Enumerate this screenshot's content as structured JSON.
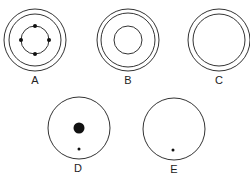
{
  "figures": [
    {
      "id": "A",
      "label": "A",
      "center": [
        35,
        40
      ],
      "rings": [
        31,
        26,
        14
      ],
      "dots": [
        {
          "x": 35,
          "y": 26,
          "r": 2
        },
        {
          "x": 35,
          "y": 54,
          "r": 2
        },
        {
          "x": 21,
          "y": 40,
          "r": 2
        },
        {
          "x": 49,
          "y": 40,
          "r": 2
        }
      ],
      "label_pos": [
        35,
        84
      ]
    },
    {
      "id": "B",
      "label": "B",
      "center": [
        128,
        40
      ],
      "rings": [
        31,
        27,
        14
      ],
      "dots": [],
      "label_pos": [
        128,
        84
      ]
    },
    {
      "id": "C",
      "label": "C",
      "center": [
        219,
        40
      ],
      "rings": [
        31,
        26
      ],
      "dots": [],
      "label_pos": [
        219,
        84
      ]
    },
    {
      "id": "D",
      "label": "D",
      "center": [
        79,
        128
      ],
      "rings": [
        31
      ],
      "dots": [
        {
          "x": 79,
          "y": 128,
          "r": 5.5
        },
        {
          "x": 79,
          "y": 149,
          "r": 1.5
        }
      ],
      "label_pos": [
        78,
        172
      ]
    },
    {
      "id": "E",
      "label": "E",
      "center": [
        174,
        129
      ],
      "rings": [
        31
      ],
      "dots": [
        {
          "x": 173,
          "y": 150,
          "r": 1.5
        }
      ],
      "label_pos": [
        174,
        173
      ]
    }
  ],
  "colors": {
    "stroke": "#333333",
    "dot": "#111111",
    "background": "#ffffff"
  }
}
